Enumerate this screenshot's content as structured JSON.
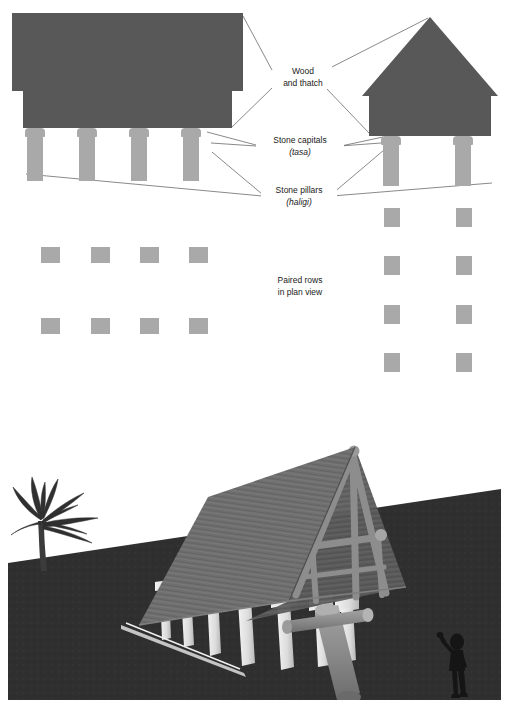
{
  "figure": {
    "kind": "architectural-diagram",
    "panels": [
      "elevation-and-plan-diagram",
      "reconstruction-illustration"
    ]
  },
  "labels": {
    "wood_and_thatch": {
      "line1": "Wood",
      "line2": "and thatch"
    },
    "stone_capitals": {
      "line1": "Stone capitals",
      "line2_italic": "(tasa)"
    },
    "stone_pillars": {
      "line1": "Stone pillars",
      "line2_italic": "(haligi)"
    },
    "paired_rows": {
      "line1": "Paired rows",
      "line2": "in plan view"
    }
  },
  "colors": {
    "thatch_dark": "#585858",
    "stone_light": "#a9a9a9",
    "leader_line": "#6b6b6b",
    "ground_dark": "#2e2e2e",
    "sky": "#ffffff",
    "roof_photo": "#6e6e6e",
    "pillar_photo": "#e6e6e6",
    "timber_photo": "#8e8e8e",
    "silhouette": "#141414"
  },
  "left_elevation": {
    "name": "long-house-elevation",
    "roof": {
      "x": 12,
      "y": 13,
      "w": 231,
      "h": 78
    },
    "body": {
      "x": 23,
      "y": 91,
      "w": 209,
      "h": 37
    },
    "pillar_count": 4,
    "pillars": [
      {
        "x": 25,
        "y": 128,
        "cap_w": 20,
        "cap_h": 9,
        "shaft_w": 15,
        "shaft_h": 44
      },
      {
        "x": 77,
        "y": 128,
        "cap_w": 20,
        "cap_h": 9,
        "shaft_w": 15,
        "shaft_h": 44
      },
      {
        "x": 129,
        "y": 128,
        "cap_w": 20,
        "cap_h": 9,
        "shaft_w": 15,
        "shaft_h": 44
      },
      {
        "x": 181,
        "y": 128,
        "cap_w": 20,
        "cap_h": 9,
        "shaft_w": 15,
        "shaft_h": 44
      }
    ]
  },
  "right_elevation": {
    "name": "square-house-elevation",
    "roof_apex": {
      "x": 430,
      "y": 17
    },
    "roof_base_w": 136,
    "roof_h": 79,
    "body": {
      "x": 369,
      "y": 96,
      "w": 122,
      "h": 40
    },
    "pillar_count": 2,
    "pillars": [
      {
        "x": 381,
        "y": 136,
        "cap_w": 20,
        "cap_h": 9,
        "shaft_w": 15,
        "shaft_h": 41
      },
      {
        "x": 453,
        "y": 136,
        "cap_w": 20,
        "cap_h": 9,
        "shaft_w": 15,
        "shaft_h": 41
      }
    ]
  },
  "left_plan": {
    "name": "long-house-plan",
    "rows": 2,
    "cols": 4,
    "square": {
      "w": 19,
      "h": 16
    },
    "x_positions": [
      41,
      91,
      140,
      189
    ],
    "y_positions": [
      247,
      318
    ]
  },
  "right_plan": {
    "name": "square-house-plan",
    "rows": 4,
    "cols": 2,
    "square": {
      "w": 16,
      "h": 19
    },
    "x_positions": [
      384,
      456
    ],
    "y_positions": [
      208,
      256,
      305,
      353
    ]
  },
  "leaders": {
    "wood_and_thatch": [
      {
        "from": [
          272,
          70
        ],
        "to": [
          243,
          16
        ]
      },
      {
        "from": [
          272,
          88
        ],
        "to": [
          232,
          127
        ]
      },
      {
        "from": [
          326,
          70
        ],
        "to": [
          428,
          18
        ]
      },
      {
        "from": [
          326,
          88
        ],
        "to": [
          369,
          133
        ]
      }
    ],
    "stone_capitals": [
      {
        "from": [
          256,
          146
        ],
        "to": [
          211,
          143
        ]
      },
      {
        "from": [
          340,
          146
        ],
        "to": [
          381,
          143
        ]
      },
      {
        "from": [
          207,
          131
        ],
        "to": [
          256,
          144
        ]
      },
      {
        "from": [
          383,
          136
        ],
        "to": [
          341,
          145
        ]
      }
    ],
    "stone_pillars": [
      {
        "from": [
          262,
          196
        ],
        "to": [
          212,
          152
        ]
      },
      {
        "from": [
          262,
          196
        ],
        "to": [
          26,
          174
        ]
      },
      {
        "from": [
          332,
          196
        ],
        "to": [
          384,
          150
        ]
      },
      {
        "from": [
          332,
          196
        ],
        "to": [
          492,
          183
        ]
      }
    ]
  },
  "label_positions": {
    "wood_and_thatch": {
      "x": 299,
      "y": 72
    },
    "stone_capitals": {
      "x": 298,
      "y": 140
    },
    "stone_pillars": {
      "x": 297,
      "y": 190
    },
    "paired_rows": {
      "x": 298,
      "y": 280
    }
  },
  "illustration": {
    "name": "latte-house-reconstruction",
    "elements": [
      "palm-tree",
      "a-frame-thatch-roof",
      "timber-truss",
      "latte-stone-pillars",
      "fallen-log",
      "human-figure",
      "dark-ground"
    ],
    "horizon_y": 138,
    "pillar_count_visible": 7,
    "figure_side": "right"
  }
}
